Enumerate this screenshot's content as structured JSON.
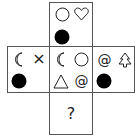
{
  "puzzle": {
    "type": "cube-net",
    "faces": {
      "top": {
        "symbols": [
          "circle-outline",
          "heart-outline",
          "filled-circle"
        ]
      },
      "left": {
        "symbols": [
          "crescent-moon",
          "x-cross",
          "filled-circle"
        ]
      },
      "center": {
        "symbols": [
          "crescent-moon",
          "circle-outline",
          "triangle-outline",
          "at-sign"
        ]
      },
      "right": {
        "symbols": [
          "at-sign",
          "tree-outline",
          "filled-circle"
        ]
      },
      "bottom": {
        "symbols": [],
        "label": "?"
      }
    },
    "glyphs": {
      "cross": "×",
      "at": "@",
      "question": "?"
    }
  }
}
